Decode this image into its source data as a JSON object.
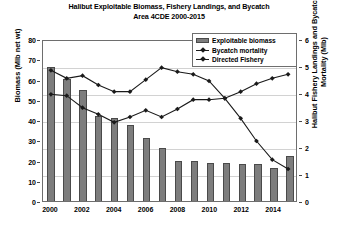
{
  "chart_data": {
    "type": "bar",
    "title": "Halibut Exploitable Biomass, Fishery Landings, and Bycatch Area 4CDE 2000-2015",
    "title_line1": "Halibut Exploitable Biomass, Fishery Landings, and Bycatch",
    "title_line2": "Area 4CDE 2000-2015",
    "xlabel": "",
    "ylabel": "Biomass (Mlb net wt)",
    "ylabel_right": "Halibut Fishery Landings and Bycatch Mortality (Mlb)",
    "ylabel_right_line1": "Halibut Fishery Landings and Bycatch",
    "ylabel_right_line2": "Mortality (Mlb)",
    "categories": [
      2000,
      2001,
      2002,
      2003,
      2004,
      2005,
      2006,
      2007,
      2008,
      2009,
      2010,
      2011,
      2012,
      2013,
      2014,
      2015
    ],
    "x": [
      "2000",
      "2001",
      "2002",
      "2003",
      "2004",
      "2005",
      "2006",
      "2007",
      "2008",
      "2009",
      "2010",
      "2011",
      "2012",
      "2013",
      "2014",
      "2015"
    ],
    "xtick_labels": [
      "2000",
      "2002",
      "2004",
      "2006",
      "2008",
      "2010",
      "2012",
      "2014"
    ],
    "ytick_labels_left": [
      "0",
      "10",
      "20",
      "30",
      "40",
      "50",
      "60",
      "70",
      "80"
    ],
    "ytick_labels_right": [
      "0",
      "1",
      "2",
      "3",
      "4",
      "5",
      "6"
    ],
    "ylim": [
      0,
      80
    ],
    "ylim_right": [
      0,
      6
    ],
    "grid": true,
    "legend_position": "top-right",
    "series": [
      {
        "name": "Exploitable biomass",
        "type": "bar",
        "axis": "left",
        "unit": "Mlb net wt",
        "color": "#7d7d7d",
        "values": [
          66.0,
          60.5,
          55.0,
          42.0,
          41.0,
          37.5,
          31.0,
          26.0,
          20.0,
          20.0,
          19.0,
          19.0,
          18.5,
          18.5,
          16.5,
          22.0
        ]
      },
      {
        "name": "Bycatch mortality",
        "type": "line",
        "axis": "right",
        "unit": "Mlb",
        "color": "#1a1a1a",
        "marker": "diamond",
        "values": [
          4.9,
          4.6,
          4.7,
          4.35,
          4.1,
          4.1,
          4.55,
          5.0,
          4.85,
          4.75,
          4.5,
          3.85,
          3.1,
          2.25,
          1.55,
          1.2
        ]
      },
      {
        "name": "Directed Fishery",
        "type": "line",
        "axis": "right",
        "unit": "Mlb",
        "color": "#1a1a1a",
        "marker": "diamond",
        "values": [
          4.0,
          3.95,
          3.5,
          3.25,
          2.95,
          3.15,
          3.4,
          3.15,
          3.45,
          3.8,
          3.8,
          3.85,
          4.1,
          4.4,
          4.6,
          4.75
        ]
      }
    ]
  },
  "legend": {
    "items": [
      {
        "label": "Exploitable biomass",
        "marker": "bar-swatch"
      },
      {
        "label": "Bycatch mortality",
        "marker": "line-diamond-swatch"
      },
      {
        "label": "Directed Fishery",
        "marker": "line-diamond-swatch"
      }
    ]
  }
}
